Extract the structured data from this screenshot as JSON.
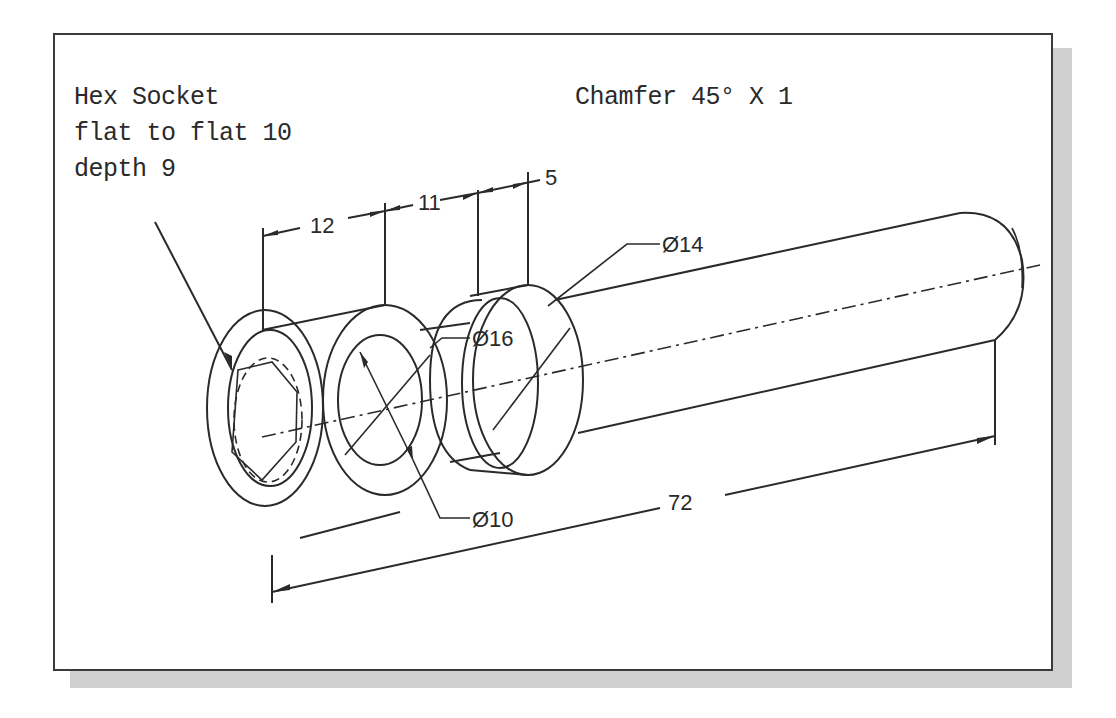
{
  "drawing": {
    "type": "isometric engineering drawing",
    "subject": "cylindrical shaft with hex socket head"
  },
  "notes": {
    "hex_socket_line1": "Hex Socket",
    "hex_socket_line2": "flat to flat 10",
    "hex_socket_line3": "depth 9",
    "chamfer": "Chamfer 45° X 1"
  },
  "dimensions": {
    "length_head": "12",
    "length_middle": "11",
    "length_collar": "5",
    "overall_length": "72",
    "dia_shaft": "Ø14",
    "dia_collar": "Ø16",
    "dia_hole": "Ø10"
  },
  "colors": {
    "line": "#2a2a2a",
    "frame_border": "#3a3a3a",
    "shadow": "#cfcfcf",
    "background": "#ffffff"
  }
}
